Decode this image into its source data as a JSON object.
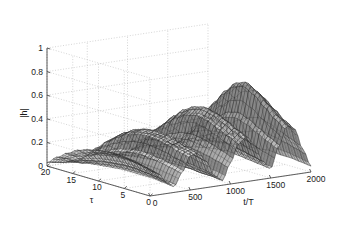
{
  "figure": {
    "type": "3d-mesh-surface-plot",
    "background_color": "#ffffff",
    "width": 339,
    "height": 241
  },
  "axes": {
    "z": {
      "label": "|h|",
      "ticks": [
        "0",
        "0.2",
        "0.4",
        "0.6",
        "0.8",
        "1"
      ],
      "tick_values": [
        0,
        0.2,
        0.4,
        0.6,
        0.8,
        1
      ],
      "range": [
        0,
        1
      ]
    },
    "y": {
      "label": "τ",
      "ticks": [
        "20",
        "15",
        "10",
        "5",
        "0"
      ],
      "tick_values": [
        20,
        15,
        10,
        5,
        0
      ],
      "range": [
        0,
        20
      ]
    },
    "x": {
      "label": "t/T",
      "ticks": [
        "0",
        "500",
        "1000",
        "1500",
        "2000"
      ],
      "tick_values": [
        0,
        500,
        1000,
        1500,
        2000
      ],
      "range": [
        0,
        2000
      ]
    }
  },
  "style": {
    "axis_color": "#4d4d4d",
    "grid_color": "#b8b8b8",
    "mesh_color": "#2a2a2a",
    "text_color": "#1a1a1a",
    "grid": "dotted"
  },
  "chart_data": {
    "type": "line",
    "render": "surface-mesh",
    "title": "",
    "xlabel": "t/T",
    "ylabel": "τ",
    "zlabel": "|h|",
    "xlim": [
      0,
      2000
    ],
    "ylim": [
      0,
      20
    ],
    "zlim": [
      0,
      1
    ],
    "grid": true,
    "legend": "none",
    "x": [
      0,
      100,
      200,
      300,
      400,
      500,
      600,
      700,
      800,
      900,
      1000,
      1100,
      1200,
      1300,
      1400,
      1500,
      1600,
      1700,
      1800,
      1900,
      2000
    ],
    "y": [
      0,
      1,
      2,
      3,
      4,
      5,
      6,
      7,
      8,
      9,
      10,
      11,
      12,
      13,
      14,
      15,
      16,
      17,
      18,
      19,
      20
    ],
    "z_peak_max": 0.7,
    "z_description": "Channel magnitude |h| surface over normalized time t/T and delay tau; several ridges and deep fades, tallest ridge near t/T=1600 reaching about 0.7",
    "series": [
      {
        "name": "tau=0",
        "values": [
          0.21,
          0.18,
          0.1,
          0.05,
          0.16,
          0.29,
          0.31,
          0.22,
          0.09,
          0.04,
          0.18,
          0.33,
          0.38,
          0.3,
          0.15,
          0.08,
          0.26,
          0.42,
          0.38,
          0.2,
          0.05
        ]
      },
      {
        "name": "tau=2",
        "values": [
          0.24,
          0.2,
          0.12,
          0.06,
          0.18,
          0.31,
          0.33,
          0.24,
          0.1,
          0.05,
          0.21,
          0.37,
          0.42,
          0.33,
          0.17,
          0.09,
          0.3,
          0.48,
          0.43,
          0.23,
          0.06
        ]
      },
      {
        "name": "tau=4",
        "values": [
          0.26,
          0.22,
          0.13,
          0.07,
          0.2,
          0.34,
          0.36,
          0.27,
          0.11,
          0.05,
          0.24,
          0.41,
          0.47,
          0.37,
          0.19,
          0.1,
          0.35,
          0.56,
          0.5,
          0.26,
          0.07
        ]
      },
      {
        "name": "tau=6",
        "values": [
          0.27,
          0.23,
          0.14,
          0.07,
          0.21,
          0.36,
          0.38,
          0.28,
          0.12,
          0.06,
          0.26,
          0.45,
          0.51,
          0.4,
          0.21,
          0.11,
          0.4,
          0.64,
          0.57,
          0.29,
          0.07
        ]
      },
      {
        "name": "tau=8",
        "values": [
          0.27,
          0.23,
          0.14,
          0.07,
          0.22,
          0.37,
          0.39,
          0.29,
          0.12,
          0.06,
          0.27,
          0.47,
          0.53,
          0.42,
          0.22,
          0.12,
          0.43,
          0.69,
          0.61,
          0.31,
          0.08
        ]
      },
      {
        "name": "tau=10",
        "values": [
          0.26,
          0.22,
          0.13,
          0.07,
          0.21,
          0.36,
          0.38,
          0.28,
          0.12,
          0.06,
          0.26,
          0.45,
          0.51,
          0.4,
          0.21,
          0.11,
          0.41,
          0.66,
          0.58,
          0.29,
          0.07
        ]
      },
      {
        "name": "tau=12",
        "values": [
          0.24,
          0.2,
          0.12,
          0.06,
          0.19,
          0.33,
          0.35,
          0.26,
          0.11,
          0.05,
          0.23,
          0.4,
          0.46,
          0.36,
          0.19,
          0.1,
          0.35,
          0.57,
          0.5,
          0.25,
          0.06
        ]
      },
      {
        "name": "tau=14",
        "values": [
          0.21,
          0.17,
          0.1,
          0.05,
          0.16,
          0.28,
          0.3,
          0.22,
          0.09,
          0.04,
          0.19,
          0.33,
          0.38,
          0.3,
          0.15,
          0.08,
          0.28,
          0.45,
          0.4,
          0.2,
          0.05
        ]
      },
      {
        "name": "tau=16",
        "values": [
          0.16,
          0.13,
          0.08,
          0.04,
          0.12,
          0.21,
          0.23,
          0.17,
          0.07,
          0.03,
          0.14,
          0.25,
          0.28,
          0.22,
          0.11,
          0.06,
          0.2,
          0.32,
          0.29,
          0.14,
          0.04
        ]
      },
      {
        "name": "tau=18",
        "values": [
          0.1,
          0.08,
          0.05,
          0.02,
          0.07,
          0.13,
          0.14,
          0.1,
          0.04,
          0.02,
          0.09,
          0.15,
          0.17,
          0.13,
          0.07,
          0.03,
          0.12,
          0.19,
          0.17,
          0.08,
          0.02
        ]
      },
      {
        "name": "tau=20",
        "values": [
          0.03,
          0.02,
          0.01,
          0.01,
          0.02,
          0.04,
          0.04,
          0.03,
          0.01,
          0.01,
          0.02,
          0.04,
          0.05,
          0.04,
          0.02,
          0.01,
          0.03,
          0.05,
          0.05,
          0.02,
          0.01
        ]
      }
    ]
  }
}
